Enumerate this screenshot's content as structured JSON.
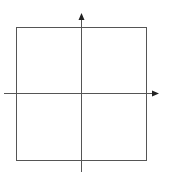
{
  "diagram": {
    "type": "coordinate-axes-with-square",
    "colors": {
      "line": "#555555",
      "background": "#ffffff"
    },
    "square": {
      "x": 16,
      "y": 27,
      "width": 130,
      "height": 133
    },
    "x_axis": {
      "x1": 4,
      "y": 93,
      "x2": 158,
      "arrow": "right"
    },
    "y_axis": {
      "x": 81,
      "y1": 172,
      "y2": 14,
      "arrow": "up"
    },
    "labels": []
  }
}
